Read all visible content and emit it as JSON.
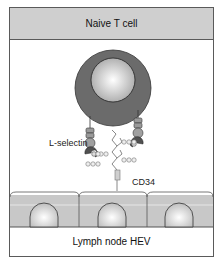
{
  "diagram": {
    "header_title": "Naive T cell",
    "footer_title": "Lymph node HEV",
    "labels": {
      "l_selectin": "L-selectin",
      "cd34": "CD34"
    },
    "colors": {
      "header_bg": "#cfcfcf",
      "cell_cytoplasm": "#6b6b6b",
      "nucleus_light": "#ffffff",
      "nucleus_dark": "#a8a8a8",
      "endothelium": "#c8c8c8",
      "border": "#5a5a5a"
    },
    "endothelial_cell_count": 3
  }
}
